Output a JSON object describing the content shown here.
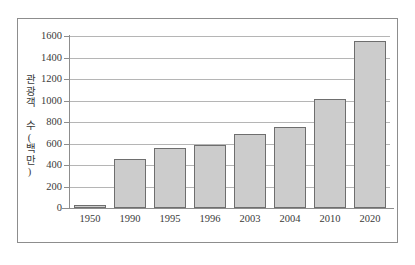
{
  "chart_data": {
    "type": "bar",
    "title": "",
    "xlabel": "",
    "ylabel": "관광객 수(백만)",
    "categories": [
      "1950",
      "1990",
      "1995",
      "1996",
      "2003",
      "2004",
      "2010",
      "2020"
    ],
    "values": [
      25,
      460,
      560,
      590,
      690,
      750,
      1010,
      1550
    ],
    "ylim": [
      0,
      1600
    ],
    "yticks": [
      "0",
      "200",
      "400",
      "600",
      "800",
      "1000",
      "1200",
      "1400",
      "1600"
    ],
    "ytick_values": [
      0,
      200,
      400,
      600,
      800,
      1000,
      1200,
      1400,
      1600
    ],
    "grid": "horizontal",
    "legend": "none",
    "bar_fill_color": "#cccccc",
    "bar_border_color": "#6e6e6e",
    "gridline_color": "#b5b5b5",
    "axis_color": "#8d8d8d",
    "text_color": "#3a3a3a",
    "background_color": "#ffffff"
  }
}
